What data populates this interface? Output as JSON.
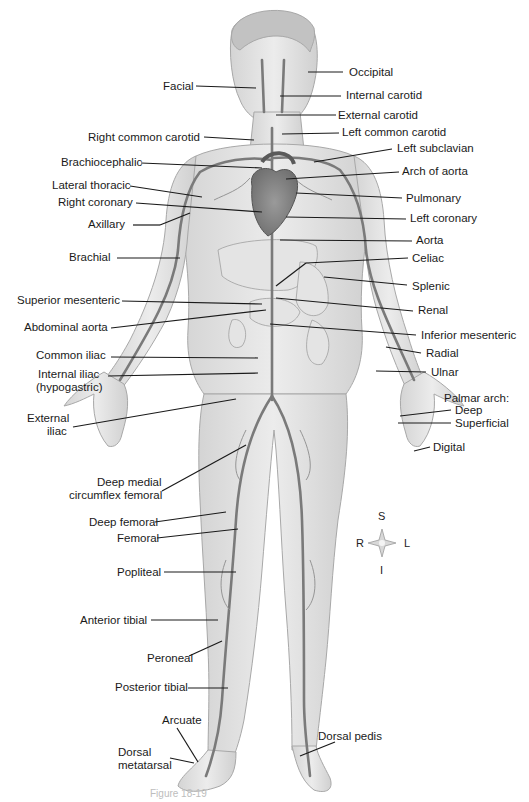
{
  "labels_left": [
    {
      "id": "facial",
      "text": "Facial",
      "x": 163,
      "y": 80
    },
    {
      "id": "right-common-carotid",
      "text": "Right common carotid",
      "x": 88,
      "y": 131
    },
    {
      "id": "brachiocephalic",
      "text": "Brachiocephalic",
      "x": 61,
      "y": 156
    },
    {
      "id": "lateral-thoracic",
      "text": "Lateral thoracic",
      "x": 52,
      "y": 179
    },
    {
      "id": "right-coronary",
      "text": "Right coronary",
      "x": 58,
      "y": 196
    },
    {
      "id": "axillary",
      "text": "Axillary",
      "x": 88,
      "y": 218
    },
    {
      "id": "brachial",
      "text": "Brachial",
      "x": 69,
      "y": 251
    },
    {
      "id": "superior-mesenteric",
      "text": "Superior mesenteric",
      "x": 17,
      "y": 294
    },
    {
      "id": "abdominal-aorta",
      "text": "Abdominal aorta",
      "x": 24,
      "y": 321
    },
    {
      "id": "common-iliac",
      "text": "Common iliac",
      "x": 36,
      "y": 349
    },
    {
      "id": "internal-iliac",
      "text": "Internal iliac",
      "x": 38,
      "y": 368
    },
    {
      "id": "internal-iliac-sub",
      "text": "(hypogastric)",
      "x": 36,
      "y": 381
    },
    {
      "id": "external-iliac",
      "text": "External",
      "x": 27,
      "y": 412
    },
    {
      "id": "external-iliac-sub",
      "text": "iliac",
      "x": 47,
      "y": 425
    },
    {
      "id": "deep-medial-circumflex",
      "text": "Deep medial",
      "x": 97,
      "y": 476
    },
    {
      "id": "deep-medial-circumflex-sub",
      "text": "circumflex femoral",
      "x": 69,
      "y": 489
    },
    {
      "id": "deep-femoral",
      "text": "Deep femoral",
      "x": 89,
      "y": 516
    },
    {
      "id": "femoral",
      "text": "Femoral",
      "x": 117,
      "y": 532
    },
    {
      "id": "popliteal",
      "text": "Popliteal",
      "x": 117,
      "y": 566
    },
    {
      "id": "anterior-tibial",
      "text": "Anterior tibial",
      "x": 80,
      "y": 614
    },
    {
      "id": "peroneal",
      "text": "Peroneal",
      "x": 147,
      "y": 652
    },
    {
      "id": "posterior-tibial",
      "text": "Posterior tibial",
      "x": 115,
      "y": 681
    },
    {
      "id": "arcuate",
      "text": "Arcuate",
      "x": 162,
      "y": 714
    },
    {
      "id": "dorsal-metatarsal",
      "text": "Dorsal",
      "x": 118,
      "y": 746
    },
    {
      "id": "dorsal-metatarsal-sub",
      "text": "metatarsal",
      "x": 118,
      "y": 759
    }
  ],
  "labels_right": [
    {
      "id": "occipital",
      "text": "Occipital",
      "x": 349,
      "y": 66
    },
    {
      "id": "internal-carotid",
      "text": "Internal carotid",
      "x": 346,
      "y": 89
    },
    {
      "id": "external-carotid",
      "text": "External carotid",
      "x": 338,
      "y": 113
    },
    {
      "id": "left-common-carotid",
      "text": "Left common carotid",
      "x": 342,
      "y": 128
    },
    {
      "id": "left-subclavian",
      "text": "Left subclavian",
      "x": 397,
      "y": 143
    },
    {
      "id": "arch-of-aorta",
      "text": "Arch of aorta",
      "x": 402,
      "y": 166
    },
    {
      "id": "pulmonary",
      "text": "Pulmonary",
      "x": 406,
      "y": 193
    },
    {
      "id": "left-coronary",
      "text": "Left coronary",
      "x": 410,
      "y": 213
    },
    {
      "id": "aorta",
      "text": "Aorta",
      "x": 416,
      "y": 235
    },
    {
      "id": "celiac",
      "text": "Celiac",
      "x": 412,
      "y": 253
    },
    {
      "id": "splenic",
      "text": "Splenic",
      "x": 412,
      "y": 281
    },
    {
      "id": "renal",
      "text": "Renal",
      "x": 418,
      "y": 304
    },
    {
      "id": "inferior-mesenteric",
      "text": "Inferior mesenteric",
      "x": 421,
      "y": 329
    },
    {
      "id": "radial",
      "text": "Radial",
      "x": 426,
      "y": 347
    },
    {
      "id": "ulnar",
      "text": "Ulnar",
      "x": 431,
      "y": 366
    },
    {
      "id": "palmar-arch",
      "text": "Palmar arch:",
      "x": 444,
      "y": 392
    },
    {
      "id": "palmar-deep",
      "text": "Deep",
      "x": 455,
      "y": 405
    },
    {
      "id": "palmar-superficial",
      "text": "Superficial",
      "x": 455,
      "y": 418
    },
    {
      "id": "digital",
      "text": "Digital",
      "x": 433,
      "y": 441
    },
    {
      "id": "dorsal-pedis",
      "text": "Dorsal pedis",
      "x": 318,
      "y": 730
    }
  ],
  "compass": {
    "superior": "S",
    "inferior": "I",
    "right": "R",
    "left": "L"
  },
  "caption": "Figure 18-19"
}
